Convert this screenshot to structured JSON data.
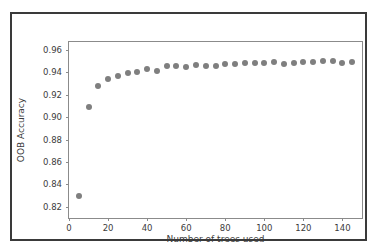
{
  "chart_data": {
    "type": "scatter",
    "title": "",
    "xlabel": "Number of trees used",
    "ylabel": "OOB Accuracy",
    "xlim": [
      0,
      150
    ],
    "ylim": [
      0.81,
      0.967
    ],
    "grid": false,
    "legend": null,
    "marker": {
      "shape": "circle",
      "color": "#7f7f7f",
      "size_px": 6
    },
    "xticks": [
      0,
      20,
      40,
      60,
      80,
      100,
      120,
      140
    ],
    "xticklabels": [
      "0",
      "20",
      "40",
      "60",
      "80",
      "100",
      "120",
      "140"
    ],
    "yticks": [
      0.82,
      0.84,
      0.86,
      0.88,
      0.9,
      0.92,
      0.94,
      0.96
    ],
    "yticklabels": [
      "0.82",
      "0.84",
      "0.86",
      "0.88",
      "0.90",
      "0.92",
      "0.94",
      "0.96"
    ],
    "x": [
      5,
      10,
      15,
      20,
      25,
      30,
      35,
      40,
      45,
      50,
      55,
      60,
      65,
      70,
      75,
      80,
      85,
      90,
      95,
      100,
      105,
      110,
      115,
      120,
      125,
      130,
      135,
      140,
      145
    ],
    "values": [
      0.83,
      0.909,
      0.928,
      0.934,
      0.937,
      0.939,
      0.94,
      0.9425,
      0.9415,
      0.946,
      0.9455,
      0.9447,
      0.9465,
      0.9452,
      0.9458,
      0.9475,
      0.9478,
      0.948,
      0.9485,
      0.9487,
      0.9488,
      0.9472,
      0.9482,
      0.9488,
      0.9492,
      0.9497,
      0.9498,
      0.9485,
      0.949
    ]
  },
  "figure": {
    "background_color": "#ffffff",
    "border_color": "#3a3a3a",
    "axes_spine_color": "#8b8b8b"
  }
}
